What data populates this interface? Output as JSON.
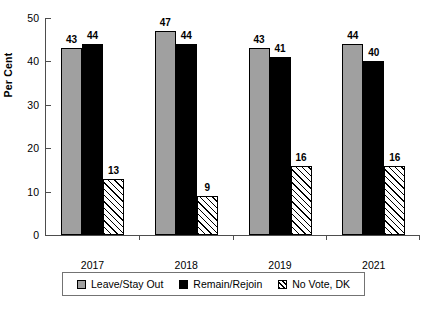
{
  "chart_data": {
    "type": "bar",
    "title": "",
    "subtitle": "",
    "xlabel": "",
    "ylabel": "Per Cent",
    "categories": [
      "2017",
      "2018",
      "2019",
      "2021"
    ],
    "series": [
      {
        "name": "Leave/Stay Out",
        "values": [
          43,
          47,
          43,
          44
        ],
        "color": "#a0a0a0",
        "fill": "solid-gray"
      },
      {
        "name": "Remain/Rejoin",
        "values": [
          44,
          44,
          41,
          40
        ],
        "color": "#000000",
        "fill": "solid-black"
      },
      {
        "name": "No Vote, DK",
        "values": [
          13,
          9,
          16,
          16
        ],
        "color": "#ffffff",
        "fill": "diagonal-hatch"
      }
    ],
    "ylim": [
      0,
      50
    ],
    "yticks": [
      0,
      10,
      20,
      30,
      40,
      50
    ],
    "ytick_labels": [
      "0",
      "10",
      "20",
      "30",
      "40",
      "50"
    ],
    "grid": false,
    "legend_position": "bottom",
    "data_labels": true
  },
  "legend": {
    "items": [
      {
        "label": "Leave/Stay Out",
        "swatch": "solid-gray"
      },
      {
        "label": "Remain/Rejoin",
        "swatch": "solid-black"
      },
      {
        "label": "No Vote, DK",
        "swatch": "diagonal-hatch"
      }
    ]
  },
  "colors": {
    "series_gray": "#a0a0a0",
    "series_black": "#000000",
    "series_hatch": "#ffffff",
    "axis": "#4d4d4d",
    "text": "#000000",
    "background": "#ffffff"
  }
}
